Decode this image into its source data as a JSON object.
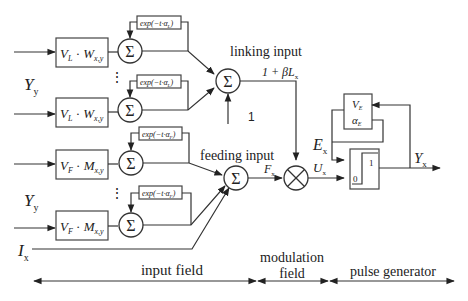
{
  "diagram": {
    "inputs": {
      "linking_input_symbol": "Y",
      "linking_input_sub": "y",
      "feeding_input_symbol": "Y",
      "feeding_input_sub": "y",
      "external_input_symbol": "I",
      "external_input_sub": "x"
    },
    "linking_branch": {
      "weight_block": "V_L · W_x,y",
      "weight_block_v": "V",
      "weight_block_v_sub": "L",
      "weight_block_w": "W",
      "weight_block_w_sub": "x,y",
      "decay_block": "exp(−t·α_L)",
      "decay_block_text": "exp(−t·α",
      "decay_block_sub": "L",
      "decay_block_close": ")",
      "sum_symbol": "Σ",
      "label": "linking input",
      "bias_value": "1",
      "output_label": "1 + βL_x",
      "output_label_main": "1 + βL",
      "output_label_sub": "x"
    },
    "feeding_branch": {
      "weight_block": "V_F · M_x,y",
      "weight_block_v": "V",
      "weight_block_v_sub": "F",
      "weight_block_m": "M",
      "weight_block_m_sub": "x,y",
      "decay_block": "exp(−t·α_F)",
      "decay_block_text": "exp(−t·α",
      "decay_block_sub": "F",
      "decay_block_close": ")",
      "sum_symbol": "Σ",
      "label": "feeding input",
      "output_label": "F_x",
      "output_label_main": "F",
      "output_label_sub": "x"
    },
    "modulation": {
      "operator": "⊗",
      "output_label": "U_x",
      "output_label_main": "U",
      "output_label_sub": "x"
    },
    "pulse_generator": {
      "threshold_params_v": "V",
      "threshold_params_v_sub": "E",
      "threshold_params_a": "α",
      "threshold_params_a_sub": "E",
      "threshold_label": "E_x",
      "threshold_label_main": "E",
      "threshold_label_sub": "x",
      "step_high": "1",
      "step_low": "0",
      "output_label": "Y_x",
      "output_label_main": "Y",
      "output_label_sub": "x"
    },
    "regions": [
      {
        "label": "input field"
      },
      {
        "label_line1": "modulation",
        "label_line2": "field"
      },
      {
        "label": "pulse generator"
      }
    ],
    "ellipsis": "⋮"
  }
}
